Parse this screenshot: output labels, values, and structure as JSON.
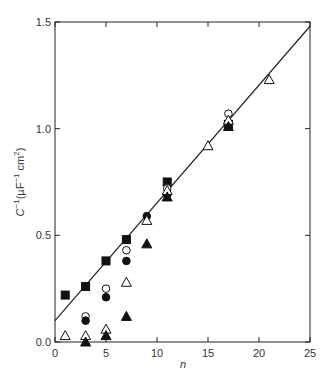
{
  "chart_data": {
    "type": "scatter",
    "title": "",
    "xlabel": "n",
    "ylabel": "C⁻¹(µF⁻¹ cm²)",
    "xlim": [
      0,
      25
    ],
    "ylim": [
      0.0,
      1.5
    ],
    "xticks": [
      0,
      5,
      10,
      15,
      20,
      25
    ],
    "xtick_labels": [
      "0",
      "5",
      "10",
      "15",
      "20",
      "25"
    ],
    "yticks": [
      0.0,
      0.5,
      1.0,
      1.5
    ],
    "ytick_labels": [
      "0.0",
      "0.5",
      "1.0",
      "1.5"
    ],
    "grid": false,
    "legend": "none",
    "fit_line": {
      "x": [
        0,
        25
      ],
      "y": [
        0.1,
        1.48
      ]
    },
    "series": [
      {
        "name": "filled-square",
        "marker": "square",
        "filled": true,
        "x": [
          1,
          3,
          5,
          7,
          11,
          17
        ],
        "y": [
          0.22,
          0.26,
          0.38,
          0.48,
          0.75,
          1.02
        ]
      },
      {
        "name": "open-circle",
        "marker": "circle",
        "filled": false,
        "x": [
          3,
          5,
          7,
          11,
          17
        ],
        "y": [
          0.12,
          0.25,
          0.43,
          0.72,
          1.07
        ]
      },
      {
        "name": "filled-circle",
        "marker": "circle",
        "filled": true,
        "x": [
          3,
          5,
          7,
          9,
          11,
          17
        ],
        "y": [
          0.1,
          0.21,
          0.38,
          0.59,
          0.69,
          1.02
        ]
      },
      {
        "name": "open-triangle",
        "marker": "triangle",
        "filled": false,
        "x": [
          1,
          3,
          5,
          7,
          9,
          11,
          15,
          17,
          21
        ],
        "y": [
          0.03,
          0.03,
          0.06,
          0.28,
          0.57,
          0.71,
          0.92,
          1.04,
          1.23
        ]
      },
      {
        "name": "filled-triangle",
        "marker": "triangle",
        "filled": true,
        "x": [
          3,
          5,
          7,
          9,
          11,
          17
        ],
        "y": [
          0.0,
          0.03,
          0.12,
          0.46,
          0.68,
          1.01
        ]
      }
    ]
  }
}
